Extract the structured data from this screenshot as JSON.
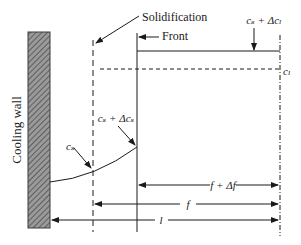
{
  "diagram": {
    "labels": {
      "cooling_wall": "Cooling wall",
      "solidification": "Solidification",
      "front": "Front",
      "cs_plus_dcl": "cₛ + Δcₗ",
      "cl": "cₗ",
      "cs_plus_dcs": "cₛ + Δcₛ",
      "cs": "cₛ",
      "f_plus_df": "f + Δf",
      "f": "f",
      "l": "l"
    },
    "colors": {
      "line": "#1a1a1a",
      "wall_fill": "#8c8c8c",
      "wall_hatch": "#5a5a5a",
      "background": "#ffffff"
    }
  }
}
